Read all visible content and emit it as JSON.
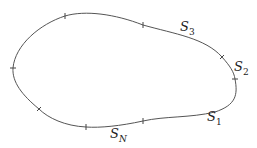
{
  "diagram": {
    "title": "",
    "curve": {
      "type": "closed-curve",
      "stroke": "#555555"
    },
    "labels": [
      {
        "id": "s3",
        "base": "S",
        "sub": "3",
        "x": 180,
        "y": 20
      },
      {
        "id": "s2",
        "base": "S",
        "sub": "2",
        "x": 234,
        "y": 60
      },
      {
        "id": "s1",
        "base": "S",
        "sub": "1",
        "x": 207,
        "y": 110
      },
      {
        "id": "sn",
        "base": "S",
        "sub": "N",
        "x": 110,
        "y": 127
      }
    ],
    "tick_count": 8
  }
}
